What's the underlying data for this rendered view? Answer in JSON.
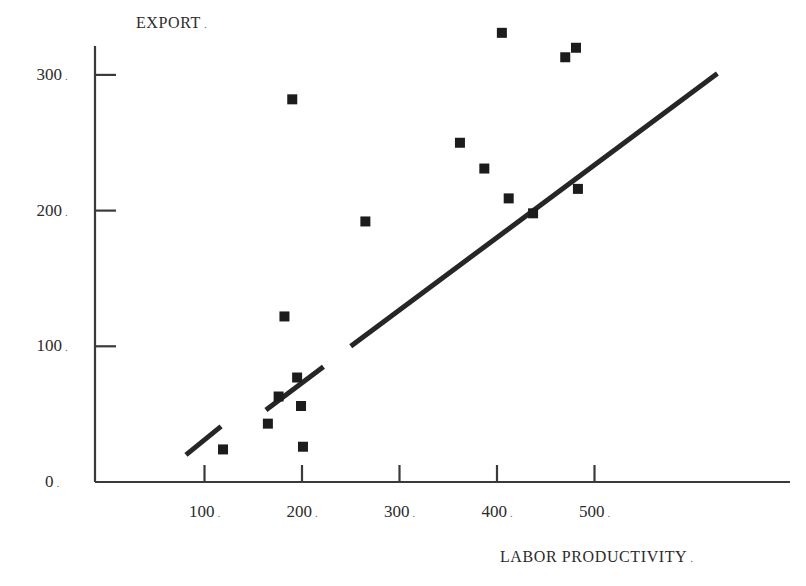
{
  "chart_data": {
    "type": "scatter",
    "title": "",
    "xlabel": "LABOR PRODUCTIVITY",
    "ylabel": "EXPORT",
    "xlim": [
      0,
      530
    ],
    "ylim": [
      0,
      320
    ],
    "grid": false,
    "legend": "none",
    "x_ticks": [
      100,
      200,
      300,
      400,
      500
    ],
    "y_ticks": [
      0,
      100,
      200,
      300
    ],
    "x_tick_labels": [
      "100",
      "200",
      "300",
      "400",
      "500"
    ],
    "y_tick_labels": [
      "0",
      "100",
      "200",
      "300"
    ],
    "points": [
      {
        "x": 119,
        "y": 24
      },
      {
        "x": 165,
        "y": 43
      },
      {
        "x": 176,
        "y": 63
      },
      {
        "x": 182,
        "y": 122
      },
      {
        "x": 190,
        "y": 282
      },
      {
        "x": 195,
        "y": 77
      },
      {
        "x": 199,
        "y": 56
      },
      {
        "x": 201,
        "y": 26
      },
      {
        "x": 265,
        "y": 192
      },
      {
        "x": 362,
        "y": 250
      },
      {
        "x": 387,
        "y": 231
      },
      {
        "x": 405,
        "y": 331
      },
      {
        "x": 412,
        "y": 209
      },
      {
        "x": 437,
        "y": 198
      },
      {
        "x": 470,
        "y": 313
      },
      {
        "x": 481,
        "y": 320
      },
      {
        "x": 483,
        "y": 216
      }
    ],
    "trendline": {
      "type": "line",
      "x_start": 81,
      "y_start": 20,
      "x_end": 626,
      "y_end": 301,
      "segments": [
        {
          "x_start": 81,
          "y_start": 20,
          "x_end": 117,
          "y_end": 41
        },
        {
          "x_start": 163,
          "y_start": 53,
          "x_end": 222,
          "y_end": 85
        },
        {
          "x_start": 250,
          "y_start": 100,
          "x_end": 626,
          "y_end": 301
        }
      ]
    },
    "marker": {
      "shape": "square",
      "color": "#1c1c1c",
      "size_px": 10
    },
    "line_color": "#262626",
    "axis_color": "#3a3a3a"
  },
  "labels": {
    "y_axis_title": "EXPORT",
    "x_axis_title": "LABOR PRODUCTIVITY"
  },
  "colors": {
    "background": "#ffffff",
    "ink": "#1c1c1c",
    "axis": "#3a3a3a",
    "marker": "#1c1c1c",
    "trendline": "#262626"
  }
}
